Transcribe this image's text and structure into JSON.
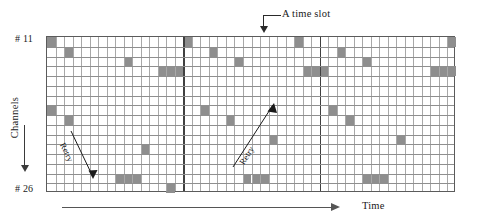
{
  "figure": {
    "type": "channel-time-slot-diagram",
    "top_annotation": "A time slot",
    "y_axis_label": "Channels",
    "x_axis_label": "Time",
    "channel_first": "# 11",
    "channel_last": "# 26",
    "retry_label_1": "Retry",
    "retry_label_2": "Retry"
  },
  "colors": {
    "cell_fill": "#8e8e8e",
    "grid_line": "#a8a8a8",
    "grid_line_major": "#404040",
    "grid_border": "#5b5b5b",
    "text": "#1a1a1a",
    "axis_arrow": "#555555"
  },
  "chart_data": {
    "type": "heatmap",
    "title": "",
    "xlabel": "Time",
    "ylabel": "Channels",
    "cols": 48,
    "rows": 16,
    "row_labels": [
      "# 11",
      "# 12",
      "# 13",
      "# 14",
      "# 15",
      "# 16",
      "# 17",
      "# 18",
      "# 19",
      "# 20",
      "# 21",
      "# 22",
      "# 23",
      "# 24",
      "# 25",
      "# 26"
    ],
    "frame_boundaries": [
      16,
      32
    ],
    "grid": "on",
    "legend": "none",
    "value_meaning": "filled cell = transmission occupying one channel in one time slot",
    "filled_cells": [
      {
        "col": 0,
        "row": 0
      },
      {
        "col": 29,
        "row": 0
      },
      {
        "col": 47,
        "row": 0
      },
      {
        "col": 16,
        "row": 0
      },
      {
        "col": 2,
        "row": 1
      },
      {
        "col": 19,
        "row": 1
      },
      {
        "col": 34,
        "row": 1
      },
      {
        "col": 9,
        "row": 2
      },
      {
        "col": 22,
        "row": 2
      },
      {
        "col": 37,
        "row": 2
      },
      {
        "col": 13,
        "row": 3
      },
      {
        "col": 14,
        "row": 3
      },
      {
        "col": 15,
        "row": 3
      },
      {
        "col": 30,
        "row": 3
      },
      {
        "col": 31,
        "row": 3
      },
      {
        "col": 32,
        "row": 3
      },
      {
        "col": 45,
        "row": 3
      },
      {
        "col": 46,
        "row": 3
      },
      {
        "col": 47,
        "row": 3
      },
      {
        "col": 0,
        "row": 7
      },
      {
        "col": 18,
        "row": 7
      },
      {
        "col": 33,
        "row": 7
      },
      {
        "col": 2,
        "row": 8
      },
      {
        "col": 21,
        "row": 8
      },
      {
        "col": 35,
        "row": 8
      },
      {
        "col": 41,
        "row": 10
      },
      {
        "col": 26,
        "row": 10
      },
      {
        "col": 11,
        "row": 11
      },
      {
        "col": 8,
        "row": 14
      },
      {
        "col": 9,
        "row": 14
      },
      {
        "col": 10,
        "row": 14
      },
      {
        "col": 23,
        "row": 14
      },
      {
        "col": 24,
        "row": 14
      },
      {
        "col": 25,
        "row": 14
      },
      {
        "col": 37,
        "row": 14
      },
      {
        "col": 38,
        "row": 14
      },
      {
        "col": 39,
        "row": 14
      },
      {
        "col": 14,
        "row": 15
      }
    ]
  }
}
